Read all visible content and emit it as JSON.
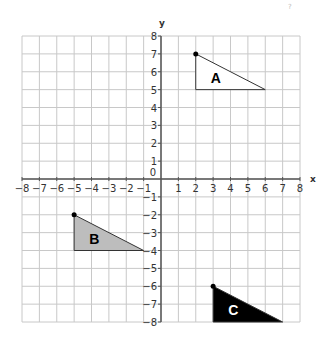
{
  "corner_mark": "?",
  "axes": {
    "x_label": "x",
    "y_label": "y",
    "origin_label": "0",
    "x_min": -8,
    "x_max": 8,
    "y_min": -8,
    "y_max": 8,
    "x_ticks": [
      "-8",
      "-7",
      "-6",
      "-5",
      "-4",
      "-3",
      "-2",
      "-1",
      "1",
      "2",
      "3",
      "4",
      "5",
      "6",
      "7",
      "8"
    ],
    "y_ticks": [
      "8",
      "7",
      "6",
      "5",
      "4",
      "3",
      "2",
      "1",
      "-1",
      "-2",
      "-3",
      "-4",
      "-5",
      "-6",
      "-7",
      "-8"
    ]
  },
  "shapes": [
    {
      "label": "A",
      "fill": "#ffffff",
      "label_color": "#000000",
      "vertices": [
        [
          2,
          7
        ],
        [
          2,
          5
        ],
        [
          6,
          5
        ]
      ],
      "marked_vertex": [
        2,
        7
      ]
    },
    {
      "label": "B",
      "fill": "#bdbdbd",
      "label_color": "#000000",
      "vertices": [
        [
          -5,
          -2
        ],
        [
          -5,
          -4
        ],
        [
          -1,
          -4
        ]
      ],
      "marked_vertex": [
        -5,
        -2
      ]
    },
    {
      "label": "C",
      "fill": "#000000",
      "label_color": "#ffffff",
      "vertices": [
        [
          3,
          -6
        ],
        [
          3,
          -8
        ],
        [
          7,
          -8
        ]
      ],
      "marked_vertex": [
        3,
        -6
      ]
    }
  ],
  "colors": {
    "grid": "#c8c8c8",
    "axis": "#555555",
    "outline": "#333333"
  }
}
